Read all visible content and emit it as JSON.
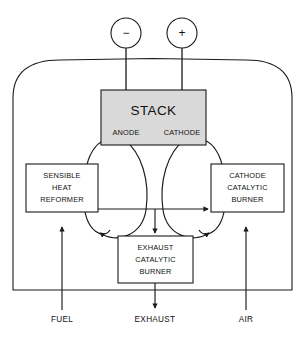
{
  "diagram": {
    "colors": {
      "stroke": "#1a1a1a",
      "stack_fill": "#d9d9d9",
      "box_fill": "#ffffff",
      "background": "#ffffff",
      "text": "#111111"
    },
    "terminals": [
      {
        "name": "negative-terminal",
        "symbol": "−",
        "cx": 126,
        "cy": 33,
        "r": 15
      },
      {
        "name": "positive-terminal",
        "symbol": "+",
        "cx": 182,
        "cy": 33,
        "r": 15
      }
    ],
    "stack": {
      "title": "STACK",
      "anode_label": "ANODE",
      "cathode_label": "CATHODE"
    },
    "blocks": [
      {
        "name": "sensible-heat-reformer",
        "lines": [
          "SENSIBLE",
          "HEAT",
          "REFORMER"
        ],
        "x": 26,
        "y": 164,
        "w": 72,
        "h": 48
      },
      {
        "name": "cathode-catalytic-burner",
        "lines": [
          "CATHODE",
          "CATALYTIC",
          "BURNER"
        ],
        "x": 211,
        "y": 164,
        "w": 73,
        "h": 48
      },
      {
        "name": "exhaust-catalytic-burner",
        "lines": [
          "EXHAUST",
          "CATALYTIC",
          "BURNER"
        ],
        "x": 118,
        "y": 236,
        "w": 75,
        "h": 47
      }
    ],
    "streams": [
      {
        "name": "fuel-inlet",
        "label": "FUEL",
        "x": 62,
        "y": 320,
        "direction": "up"
      },
      {
        "name": "exhaust-outlet",
        "label": "EXHAUST",
        "x": 155,
        "y": 320,
        "direction": "down"
      },
      {
        "name": "air-inlet",
        "label": "AIR",
        "x": 246,
        "y": 320,
        "direction": "up"
      }
    ],
    "enclosure": {
      "name": "system-enclosure",
      "left": 13,
      "right": 292,
      "bottom": 290,
      "arch_top": 60
    }
  }
}
